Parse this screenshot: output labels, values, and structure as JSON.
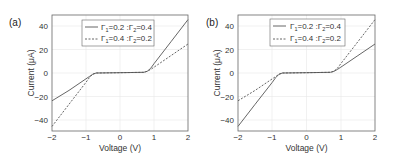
{
  "chart_data": [
    {
      "type": "line",
      "panel_label": "(a)",
      "title": "",
      "xlabel": "Voltage (V)",
      "ylabel": "Current  (μA)",
      "xlim": [
        -2,
        2
      ],
      "ylim": [
        -50,
        50
      ],
      "xticks": [
        "-2",
        "-1",
        "0",
        "1",
        "2"
      ],
      "yticks": [
        "40",
        "20",
        "0",
        "-20",
        "-40"
      ],
      "grid": true,
      "legend_position": "upper center",
      "x": [
        -2,
        -1.5,
        -1,
        -0.9,
        -0.8,
        -0.7,
        0,
        0.7,
        0.8,
        0.9,
        1,
        1.5,
        2
      ],
      "series": [
        {
          "name": "Γ₁=0.2 :Γ₂=0.4",
          "style": "solid",
          "values": [
            -24,
            -15,
            -5,
            -3,
            -1,
            0,
            0.3,
            0.6,
            1.5,
            4,
            8,
            27,
            46
          ]
        },
        {
          "name": "Γ₁=0.4 :Γ₂=0.2",
          "style": "dashed",
          "values": [
            -46,
            -27,
            -8,
            -4,
            -1,
            0,
            0.3,
            0.6,
            1.5,
            3,
            5,
            15,
            25
          ]
        }
      ]
    },
    {
      "type": "line",
      "panel_label": "(b)",
      "title": "",
      "xlabel": "Voltage (V)",
      "ylabel": "Current  (μA)",
      "xlim": [
        -2,
        2
      ],
      "ylim": [
        -50,
        50
      ],
      "xticks": [
        "-2",
        "-1",
        "0",
        "1",
        "2"
      ],
      "yticks": [
        "40",
        "20",
        "0",
        "-20",
        "-40"
      ],
      "grid": true,
      "legend_position": "upper center",
      "x": [
        -2,
        -1.5,
        -1,
        -0.9,
        -0.8,
        -0.7,
        0,
        0.7,
        0.8,
        0.9,
        1,
        1.5,
        2
      ],
      "series": [
        {
          "name": "Γ₁=0.2 :Γ₂=0.4",
          "style": "solid",
          "values": [
            -46,
            -27,
            -8,
            -4,
            -1,
            0,
            0.3,
            0.6,
            1.5,
            3,
            5,
            15,
            25
          ]
        },
        {
          "name": "Γ₁=0.4 :Γ₂=0.2",
          "style": "dashed",
          "values": [
            -24,
            -15,
            -5,
            -3,
            -1,
            0,
            0.3,
            0.6,
            1.5,
            4,
            8,
            27,
            46
          ]
        }
      ]
    }
  ],
  "panels": [
    {
      "label": "(a)",
      "xlabel": "Voltage (V)",
      "ylabel": "Current  (μA)",
      "xticks": [
        "−2",
        "−1",
        "0",
        "1",
        "2"
      ],
      "yticks": [
        "40",
        "20",
        "0",
        "−20",
        "−40"
      ],
      "legend": [
        {
          "g1": "Γ",
          "s1": "1",
          "v1": "=0.2 :",
          "g2": "Γ",
          "s2": "2",
          "v2": "=0.4"
        },
        {
          "g1": "Γ",
          "s1": "1",
          "v1": "=0.4 :",
          "g2": "Γ",
          "s2": "2",
          "v2": "=0.2"
        }
      ]
    },
    {
      "label": "(b)",
      "xlabel": "Voltage (V)",
      "ylabel": "Current  (μA)",
      "xticks": [
        "−2",
        "−1",
        "0",
        "1",
        "2"
      ],
      "yticks": [
        "40",
        "20",
        "0",
        "−20",
        "−40"
      ],
      "legend": [
        {
          "g1": "Γ",
          "s1": "1",
          "v1": "=0.2 :",
          "g2": "Γ",
          "s2": "2",
          "v2": "=0.4"
        },
        {
          "g1": "Γ",
          "s1": "1",
          "v1": "=0.4 :",
          "g2": "Γ",
          "s2": "2",
          "v2": "=0.2"
        }
      ]
    }
  ],
  "colors": {
    "line": "#555555",
    "grid": "#e6e6e6",
    "frame": "#666666"
  }
}
